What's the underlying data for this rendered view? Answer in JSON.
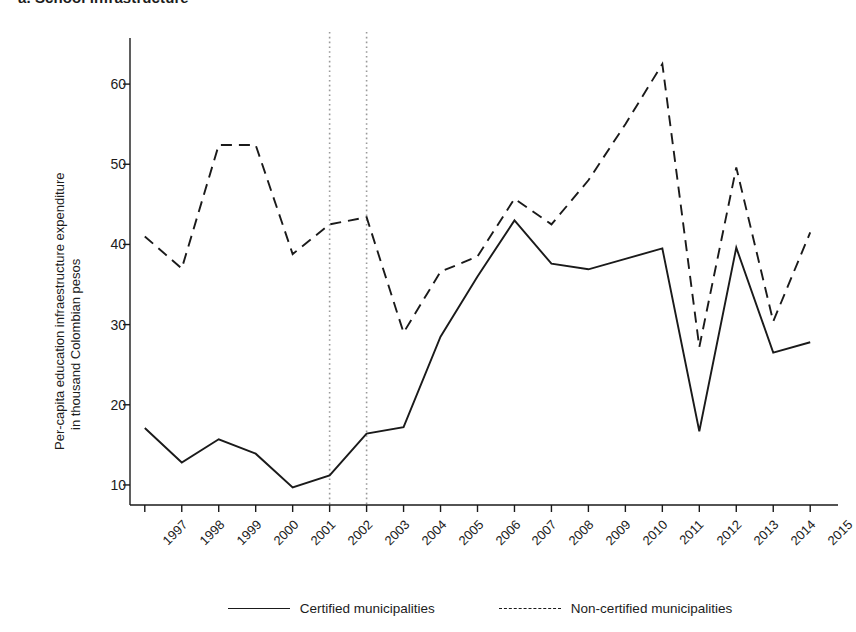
{
  "panel": {
    "title": "a. School infrastructure"
  },
  "chart_data": {
    "type": "line",
    "title": "a. School infrastructure",
    "xlabel": "",
    "ylabel": "Per-capita education infraestructure expenditure\nin thousand Colombian pesos",
    "ylabel_line_1": "Per-capita education infraestructure expenditure",
    "ylabel_line_2": "in thousand Colombian pesos",
    "x": [
      1997,
      1998,
      1999,
      2000,
      2001,
      2002,
      2003,
      2004,
      2005,
      2006,
      2007,
      2008,
      2009,
      2010,
      2011,
      2012,
      2013,
      2014,
      2015
    ],
    "xtick_labels": [
      "1997",
      "1998",
      "1999",
      "2000",
      "2001",
      "2002",
      "2003",
      "2004",
      "2005",
      "2006",
      "2007",
      "2008",
      "2009",
      "2010",
      "2011",
      "2012",
      "2013",
      "2014",
      "2015"
    ],
    "ytick_labels": [
      "10",
      "20",
      "30",
      "40",
      "50",
      "60"
    ],
    "yticks": [
      10,
      20,
      30,
      40,
      50,
      60
    ],
    "ylim": [
      7.5,
      65.5
    ],
    "xlim": [
      1996.6,
      2015.4
    ],
    "grid": false,
    "legend_position": "bottom",
    "series": [
      {
        "name": "Certified municipalities",
        "style": "solid",
        "color": "#1a1a1a",
        "values": [
          17.1,
          12.8,
          15.7,
          13.9,
          9.7,
          11.2,
          16.4,
          17.2,
          28.5,
          36.0,
          43.0,
          37.6,
          36.9,
          38.2,
          39.5,
          16.7,
          39.6,
          26.5,
          27.8
        ]
      },
      {
        "name": "Non-certified municipalities",
        "style": "dashed",
        "color": "#1a1a1a",
        "values": [
          41.0,
          37.0,
          52.4,
          52.4,
          38.8,
          42.5,
          43.4,
          29.0,
          36.6,
          38.5,
          45.7,
          42.5,
          48.0,
          55.0,
          62.5,
          27.2,
          49.6,
          30.4,
          41.5
        ]
      }
    ],
    "annotations": {
      "vertical_reference_lines": [
        {
          "name": "reference-line-2002",
          "x": 2002,
          "style": "dotted",
          "color": "#9a9a9a"
        },
        {
          "name": "reference-line-2003",
          "x": 2003,
          "style": "dotted",
          "color": "#9a9a9a"
        }
      ]
    }
  },
  "legend": {
    "items": [
      {
        "label": "Certified municipalities",
        "style": "solid"
      },
      {
        "label": "Non-certified municipalities",
        "style": "dashed"
      }
    ]
  },
  "colors": {
    "line": "#1a1a1a",
    "axis": "#1a1a1a",
    "reference_line": "#9a9a9a",
    "background": "#ffffff"
  }
}
